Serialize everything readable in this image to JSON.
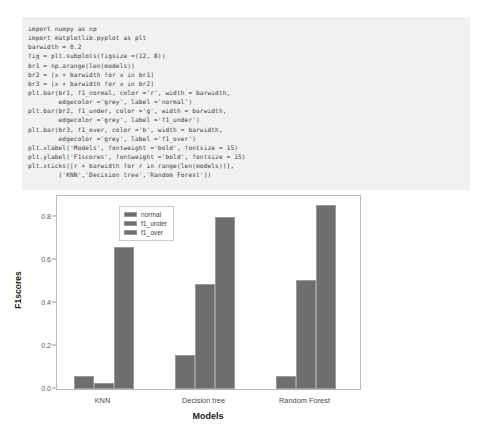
{
  "code": {
    "language": "python",
    "lines": [
      "import numpy as np",
      "import matplotlib.pyplot as plt",
      "barwidth = 0.2",
      "fig = plt.subplots(figsize =(12, 8))",
      "br1 = np.arange(len(models))",
      "br2 = [x + barwidth for x in br1]",
      "br3 = [x + barwidth for x in br2]",
      "plt.bar(br1, f1_normal, color ='r', width = barwidth,",
      "        edgecolor ='grey', label ='normal')",
      "plt.bar(br2, f1_under, color ='g', width = barwidth,",
      "        edgecolor ='grey', label ='f1_under')",
      "plt.bar(br3, f1_over, color ='b', width = barwidth,",
      "        edgecolor ='grey', label ='f1_over')",
      "plt.xlabel('Models', fontweight ='bold', fontsize = 15)",
      "plt.ylabel('F1scores', fontweight ='bold', fontsize = 15)",
      "plt.xticks([r + barwidth for r in range(len(models))],",
      "        ['KNN','Decision tree','Random Forest'])",
      "",
      "plt.legend()",
      "plt.show()"
    ]
  },
  "chart_data": {
    "type": "bar",
    "title": "",
    "xlabel": "Models",
    "ylabel": "F1scores",
    "categories": [
      "KNN",
      "Decision tree",
      "Random Forest"
    ],
    "series": [
      {
        "name": "normal",
        "values": [
          0.06,
          0.16,
          0.06
        ],
        "color": "#6e6e6e"
      },
      {
        "name": "f1_under",
        "values": [
          0.03,
          0.49,
          0.51
        ],
        "color": "#6e6e6e"
      },
      {
        "name": "f1_over",
        "values": [
          0.66,
          0.8,
          0.86
        ],
        "color": "#6e6e6e"
      }
    ],
    "yticks": [
      "0.0",
      "0.2",
      "0.4",
      "0.6",
      "0.8"
    ],
    "ytick_values": [
      0.0,
      0.2,
      0.4,
      0.6,
      0.8
    ],
    "ylim": [
      0.0,
      0.9
    ],
    "grid": false,
    "legend_position": "upper-left",
    "bar_edge_color": "#9a9a9a"
  }
}
